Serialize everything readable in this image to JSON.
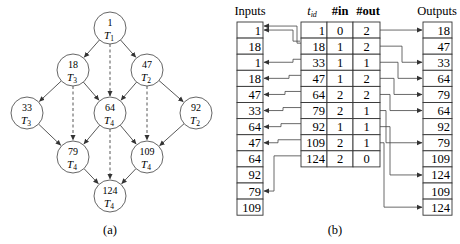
{
  "part_a": {
    "caption": "(a)",
    "nodes": [
      {
        "id": "1",
        "task": "T",
        "sub": "1",
        "x": 110,
        "y": 28
      },
      {
        "id": "18",
        "task": "T",
        "sub": "3",
        "x": 73,
        "y": 70
      },
      {
        "id": "47",
        "task": "T",
        "sub": "2",
        "x": 147,
        "y": 70
      },
      {
        "id": "33",
        "task": "T",
        "sub": "3",
        "x": 27,
        "y": 113
      },
      {
        "id": "64",
        "task": "T",
        "sub": "4",
        "x": 110,
        "y": 113
      },
      {
        "id": "92",
        "task": "T",
        "sub": "2",
        "x": 196,
        "y": 113
      },
      {
        "id": "79",
        "task": "T",
        "sub": "4",
        "x": 73,
        "y": 157
      },
      {
        "id": "109",
        "task": "T",
        "sub": "4",
        "x": 147,
        "y": 157
      },
      {
        "id": "124",
        "task": "T",
        "sub": "4",
        "x": 110,
        "y": 196
      }
    ],
    "solid_edges": [
      [
        "1",
        "18"
      ],
      [
        "1",
        "47"
      ],
      [
        "18",
        "33"
      ],
      [
        "18",
        "64"
      ],
      [
        "47",
        "64"
      ],
      [
        "47",
        "92"
      ],
      [
        "33",
        "79"
      ],
      [
        "64",
        "79"
      ],
      [
        "64",
        "109"
      ],
      [
        "92",
        "109"
      ],
      [
        "79",
        "124"
      ],
      [
        "109",
        "124"
      ]
    ],
    "dashed_edges": [
      [
        "1",
        "64"
      ],
      [
        "18",
        "79"
      ],
      [
        "47",
        "109"
      ],
      [
        "64",
        "124"
      ]
    ]
  },
  "part_b": {
    "caption": "(b)",
    "inputs_label": "Inputs",
    "outputs_label": "Outputs",
    "table_headers": {
      "tid": "t",
      "tid_sub": "id",
      "in": "#in",
      "out": "#out"
    },
    "inputs": [
      "1",
      "18",
      "1",
      "18",
      "47",
      "33",
      "64",
      "47",
      "64",
      "92",
      "79",
      "109"
    ],
    "rows": [
      {
        "tid": "1",
        "in": "0",
        "out": "2"
      },
      {
        "tid": "18",
        "in": "1",
        "out": "2"
      },
      {
        "tid": "33",
        "in": "1",
        "out": "1"
      },
      {
        "tid": "47",
        "in": "1",
        "out": "2"
      },
      {
        "tid": "64",
        "in": "2",
        "out": "2"
      },
      {
        "tid": "79",
        "in": "2",
        "out": "1"
      },
      {
        "tid": "92",
        "in": "1",
        "out": "1"
      },
      {
        "tid": "109",
        "in": "2",
        "out": "1"
      },
      {
        "tid": "124",
        "in": "2",
        "out": "0"
      }
    ],
    "outputs": [
      "18",
      "47",
      "33",
      "64",
      "79",
      "64",
      "92",
      "79",
      "109",
      "124",
      "109",
      "124"
    ]
  }
}
